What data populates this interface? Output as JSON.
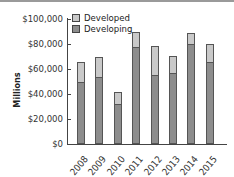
{
  "chart_data": {
    "type": "bar",
    "stacked": true,
    "title": "",
    "xlabel": "",
    "ylabel": "Millions",
    "ylim": [
      0,
      100000
    ],
    "yticks": [
      "$0",
      "$20,000",
      "$40,000",
      "$60,000",
      "$80,000",
      "$100,000"
    ],
    "categories": [
      "2008",
      "2009",
      "2010",
      "2011",
      "2012",
      "2013",
      "2014",
      "2015"
    ],
    "series": [
      {
        "name": "Developing",
        "color": "#8d8d8d",
        "values": [
          50000,
          53500,
          32000,
          77500,
          55000,
          57000,
          80000,
          65500
        ]
      },
      {
        "name": "Developed",
        "color": "#c9c9c9",
        "values": [
          15500,
          16000,
          9500,
          12000,
          23500,
          13500,
          9000,
          14500
        ]
      }
    ],
    "totals": [
      65500,
      69500,
      41500,
      89500,
      78500,
      70500,
      89000,
      80000
    ],
    "legend": {
      "position": "top-left",
      "entries": [
        "Developed",
        "Developing"
      ]
    },
    "grid": false
  },
  "legend": {
    "developed": "Developed",
    "developing": "Developing"
  },
  "axis": {
    "ylabel": "Millions",
    "yticks": [
      "$100,000",
      "$80,000",
      "$60,000",
      "$40,000",
      "$20,000",
      "$0"
    ],
    "xticks": [
      "2008",
      "2009",
      "2010",
      "2011",
      "2012",
      "2013",
      "2014",
      "2015"
    ]
  }
}
